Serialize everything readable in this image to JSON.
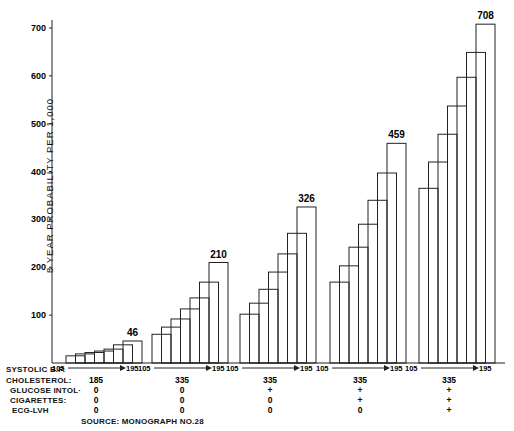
{
  "chart_data": {
    "type": "bar",
    "title": "",
    "ylabel": "8 YEAR PROBABILITY PER 1,000",
    "xlabel": "SYSTOLIC B.P. 105 → 195 (per group)",
    "ylim": [
      0,
      700
    ],
    "yticks": [
      100,
      200,
      300,
      400,
      500,
      600,
      700
    ],
    "grid": false,
    "legend": null,
    "groups": [
      {
        "sbp_range": [
          "105",
          "195"
        ],
        "cholesterol": "185",
        "glucose_intol": "0",
        "cigarettes": "0",
        "ecg_lvh": "0",
        "values": [
          15,
          19,
          22,
          25,
          29,
          38,
          46
        ],
        "top_label": "46"
      },
      {
        "sbp_range": [
          "105",
          "195"
        ],
        "cholesterol": "335",
        "glucose_intol": "0",
        "cigarettes": "0",
        "ecg_lvh": "0",
        "values": [
          60,
          75,
          92,
          113,
          136,
          169,
          210
        ],
        "top_label": "210"
      },
      {
        "sbp_range": [
          "105",
          "195"
        ],
        "cholesterol": "335",
        "glucose_intol": "+",
        "cigarettes": "0",
        "ecg_lvh": "0",
        "values": [
          102,
          125,
          154,
          190,
          228,
          271,
          326
        ],
        "top_label": "326"
      },
      {
        "sbp_range": [
          "105",
          "195"
        ],
        "cholesterol": "335",
        "glucose_intol": "+",
        "cigarettes": "+",
        "ecg_lvh": "0",
        "values": [
          169,
          203,
          242,
          290,
          340,
          397,
          459
        ],
        "top_label": "459"
      },
      {
        "sbp_range": [
          "105",
          "195"
        ],
        "cholesterol": "335",
        "glucose_intol": "+",
        "cigarettes": "+",
        "ecg_lvh": "+",
        "values": [
          365,
          420,
          478,
          537,
          597,
          649,
          708
        ],
        "top_label": "708"
      }
    ],
    "row_labels": [
      "SYSTOLIC B.P.",
      "CHOLESTEROL:",
      "GLUCOSE INTOL:",
      "CIGARETTES:",
      "ECG-LVH"
    ],
    "source": "SOURCE: MONOGRAPH NO.28"
  },
  "labels": {
    "ylabel": "8 YEAR PROBABILITY PER 1,000",
    "row_sbp": "SYSTOLIC B.P.",
    "row_chol": "CHOLESTEROL:",
    "row_gluc": "GLUCOSE INTOL·",
    "row_cig": "CIGARETTES:",
    "row_ecg": "ECG-LVH",
    "source": "SOURCE: MONOGRAPH NO.28"
  }
}
